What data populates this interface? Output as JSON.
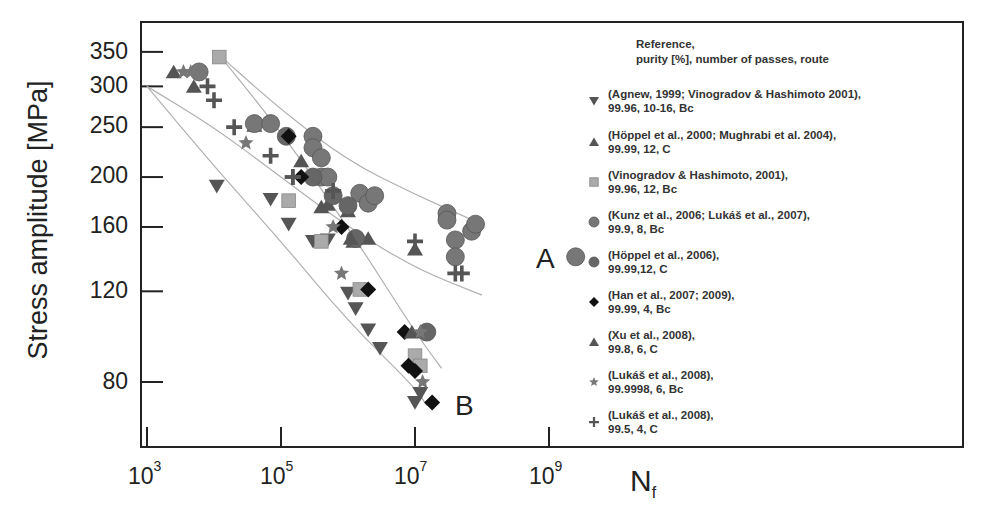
{
  "chart_data": {
    "type": "scatter",
    "title": "",
    "xlabel": "N_f",
    "ylabel": "Stress amplitude  [MPa]",
    "xscale": "log",
    "yscale": "log",
    "xlim": [
      1000,
      10000000000
    ],
    "ylim": [
      62,
      420
    ],
    "xticks": [
      1000,
      100000,
      10000000,
      1000000000
    ],
    "xtick_labels": [
      "10^3",
      "10^5",
      "10^7",
      "10^9"
    ],
    "yticks": [
      80,
      120,
      160,
      200,
      250,
      300,
      350
    ],
    "ytick_labels": [
      "80",
      "120",
      "160",
      "200",
      "250",
      "300",
      "350"
    ],
    "grid": false,
    "legend_position": "right, inside plot frame",
    "legend_title": [
      "Reference,",
      "purity [%], number of passes, route"
    ],
    "annotations": [
      {
        "text": "A",
        "x": 3200000000.0,
        "y": 140
      },
      {
        "text": "B",
        "x": 25000000.0,
        "y": 74
      }
    ],
    "band_curves": [
      {
        "name": "A upper",
        "points": [
          [
            12000.0,
            345
          ],
          [
            100000.0,
            270
          ],
          [
            1000000.0,
            215
          ],
          [
            10000000.0,
            185
          ],
          [
            100000000.0,
            162
          ]
        ]
      },
      {
        "name": "A lower",
        "points": [
          [
            1000.0,
            300
          ],
          [
            10000.0,
            250
          ],
          [
            100000.0,
            200
          ],
          [
            1000000.0,
            160
          ],
          [
            10000000.0,
            133
          ],
          [
            100000000.0,
            118
          ]
        ]
      },
      {
        "name": "B upper",
        "points": [
          [
            12000.0,
            345
          ],
          [
            100000.0,
            245
          ],
          [
            1000000.0,
            160
          ],
          [
            10000000.0,
            100
          ],
          [
            25000000.0,
            85
          ]
        ]
      },
      {
        "name": "B lower",
        "points": [
          [
            1000.0,
            300
          ],
          [
            10000.0,
            210
          ],
          [
            100000.0,
            150
          ],
          [
            1000000.0,
            105
          ],
          [
            10000000.0,
            78
          ],
          [
            15000000.0,
            72
          ]
        ]
      }
    ],
    "series": [
      {
        "name": "(Agnew, 1999; Vinogradov & Hashimoto 2001), 99.96, 10-16, Bc",
        "marker": "triangle-down",
        "color": "#555555",
        "points": [
          [
            11000.0,
            192
          ],
          [
            70000.0,
            181
          ],
          [
            130000.0,
            162
          ],
          [
            300000.0,
            150
          ],
          [
            500000.0,
            151
          ],
          [
            1000000.0,
            119
          ],
          [
            1300000.0,
            111
          ],
          [
            2000000.0,
            101
          ],
          [
            3000000.0,
            93
          ],
          [
            10000000.0,
            84
          ],
          [
            12000000.0,
            76
          ],
          [
            10000000.0,
            73
          ]
        ]
      },
      {
        "name": "(Höppel et al., 2000; Mughrabi et al. 2004), 99.99, 12, C",
        "marker": "triangle-up",
        "color": "#555555",
        "points": [
          [
            2500.0,
            320
          ],
          [
            5000.0,
            300
          ],
          [
            40000.0,
            252
          ],
          [
            200000.0,
            215
          ],
          [
            500000.0,
            177
          ],
          [
            1000000.0,
            172
          ],
          [
            1200000.0,
            150
          ],
          [
            2000000.0,
            152
          ]
        ]
      },
      {
        "name": "(Vinogradov & Hashimoto, 2001), 99.96, 12, Bc",
        "marker": "square",
        "color": "#aaaaaa",
        "points": [
          [
            12000.0,
            342
          ],
          [
            130000.0,
            180
          ],
          [
            400000.0,
            150
          ],
          [
            1500000.0,
            121
          ],
          [
            10000000.0,
            90
          ],
          [
            12000000.0,
            86
          ]
        ]
      },
      {
        "name": "(Kunz et al., 2006; Lukáš et al., 2007), 99.9, 8, Bc",
        "marker": "circle",
        "color": "#777777",
        "points": [
          [
            6000.0,
            320
          ],
          [
            40000.0,
            254
          ],
          [
            70000.0,
            254
          ],
          [
            300000.0,
            240
          ],
          [
            300000.0,
            228
          ],
          [
            400000.0,
            218
          ],
          [
            400000.0,
            200
          ],
          [
            500000.0,
            200
          ],
          [
            1500000.0,
            186
          ],
          [
            2000000.0,
            178
          ],
          [
            2500000.0,
            184
          ],
          [
            30000000.0,
            170
          ],
          [
            30000000.0,
            165
          ],
          [
            40000000.0,
            151
          ],
          [
            40000000.0,
            140
          ],
          [
            70000000.0,
            157
          ],
          [
            80000000.0,
            162
          ],
          [
            2500000000.0,
            140
          ]
        ]
      },
      {
        "name": "(Höppel et al., 2006), 99.99,12, C",
        "marker": "circle",
        "color": "#666666",
        "points": [
          [
            120000.0,
            240
          ],
          [
            300000.0,
            200
          ],
          [
            600000.0,
            184
          ],
          [
            1000000.0,
            176
          ],
          [
            1300000.0,
            152
          ],
          [
            15000000.0,
            100
          ]
        ]
      },
      {
        "name": "(Han et al., 2007; 2009), 99.99, 4, Bc",
        "marker": "diamond",
        "color": "#111111",
        "points": [
          [
            130000.0,
            240
          ],
          [
            200000.0,
            200
          ],
          [
            800000.0,
            160
          ],
          [
            2000000.0,
            121
          ],
          [
            7000000.0,
            100
          ],
          [
            8000000.0,
            86
          ],
          [
            10000000.0,
            84
          ],
          [
            18000000.0,
            73
          ]
        ]
      },
      {
        "name": "(Xu et al., 2008), 99.8, 6, C",
        "marker": "triangle-up",
        "color": "#555555",
        "points": [
          [
            400000.0,
            175
          ],
          [
            1100000.0,
            152
          ],
          [
            9000000.0,
            100
          ],
          [
            10000000.0,
            145
          ]
        ]
      },
      {
        "name": "(Lukáš et al., 2008), 99.9998, 6, Bc",
        "marker": "star",
        "color": "#777777",
        "points": [
          [
            3500.0,
            320
          ],
          [
            4500.0,
            320
          ],
          [
            30000.0,
            233
          ],
          [
            600000.0,
            160
          ],
          [
            800000.0,
            130
          ],
          [
            12000000.0,
            100
          ],
          [
            13000000.0,
            80
          ]
        ]
      },
      {
        "name": "(Lukáš et al., 2008), 99.5, 4, C",
        "marker": "plus",
        "color": "#555555",
        "points": [
          [
            8000.0,
            300
          ],
          [
            10000.0,
            282
          ],
          [
            20000.0,
            250
          ],
          [
            70000.0,
            220
          ],
          [
            150000.0,
            200
          ],
          [
            150000.0,
            200
          ],
          [
            600000.0,
            188
          ],
          [
            10000000.0,
            150
          ],
          [
            40000000.0,
            130
          ],
          [
            50000000.0,
            130
          ]
        ]
      }
    ]
  },
  "axes": {
    "ylabel": "Stress amplitude  [MPa]",
    "xlabel_main": "N",
    "xlabel_sub": "f",
    "xticks": [
      {
        "base": "10",
        "exp": "3"
      },
      {
        "base": "10",
        "exp": "5"
      },
      {
        "base": "10",
        "exp": "7"
      },
      {
        "base": "10",
        "exp": "9"
      }
    ],
    "yticks": [
      "350",
      "300",
      "250",
      "200",
      "160",
      "120",
      "80"
    ]
  },
  "labels": {
    "curve_a": "A",
    "curve_b": "B"
  },
  "legend": {
    "title_line1": "Reference,",
    "title_line2": "purity [%], number of passes, route",
    "entries": [
      {
        "line1": "(Agnew, 1999; Vinogradov & Hashimoto 2001),",
        "line2": "99.96, 10-16, Bc"
      },
      {
        "line1": "(Höppel et al., 2000; Mughrabi et al. 2004),",
        "line2": "99.99, 12, C"
      },
      {
        "line1": "(Vinogradov & Hashimoto, 2001),",
        "line2": "99.96, 12, Bc"
      },
      {
        "line1": "(Kunz et al., 2006; Lukáš et al., 2007),",
        "line2": "99.9, 8, Bc"
      },
      {
        "line1": "(Höppel et al., 2006),",
        "line2": "99.99,12, C"
      },
      {
        "line1": "(Han et al., 2007; 2009),",
        "line2": "99.99, 4, Bc"
      },
      {
        "line1": "(Xu et al., 2008),",
        "line2": "99.8, 6, C"
      },
      {
        "line1": "(Lukáš et al., 2008),",
        "line2": "99.9998, 6, Bc"
      },
      {
        "line1": "(Lukáš et al., 2008),",
        "line2": "99.5, 4, C"
      }
    ]
  }
}
